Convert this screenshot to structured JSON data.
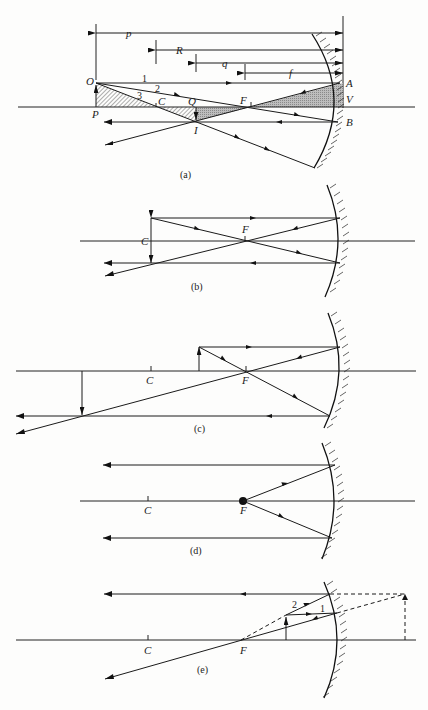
{
  "figure": {
    "type": "concave mirror ray diagrams",
    "panels": [
      {
        "id": "a",
        "caption": "(a)",
        "labels": {
          "object_top": "O",
          "object_base": "P",
          "center": "C",
          "image_base": "Q",
          "image_top": "I",
          "focus": "F",
          "mirror_top": "A",
          "vertex": "V",
          "mirror_bottom": "B",
          "ray1": "1",
          "ray2": "2",
          "ray3": "3"
        },
        "dimensions": {
          "object_distance": "p",
          "radius": "R",
          "image_distance": "q",
          "focal_length": "f"
        }
      },
      {
        "id": "b",
        "caption": "(b)",
        "labels": {
          "center": "C",
          "focus": "F"
        }
      },
      {
        "id": "c",
        "caption": "(c)",
        "labels": {
          "center": "C",
          "focus": "F"
        }
      },
      {
        "id": "d",
        "caption": "(d)",
        "labels": {
          "center": "C",
          "focus": "F"
        }
      },
      {
        "id": "e",
        "caption": "(e)",
        "labels": {
          "center": "C",
          "focus": "F",
          "ray1": "1",
          "ray2": "2"
        }
      }
    ]
  }
}
